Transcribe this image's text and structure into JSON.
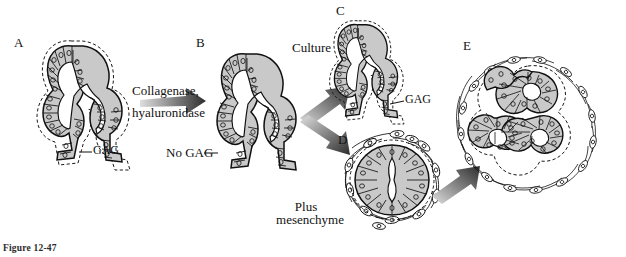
{
  "figure": {
    "caption": "Figure 12-47",
    "background_color": "#ffffff",
    "ink_color": "#111111",
    "cell_fill": "#c9c9c9",
    "mesenchyme_fill": "#ffffff"
  },
  "panels": [
    {
      "id": "A",
      "letter": "A",
      "x": 14,
      "y": 36,
      "description": "epithelial bud with GAG coat"
    },
    {
      "id": "B",
      "letter": "B",
      "x": 196,
      "y": 36,
      "description": "epithelial bud after enzyme, GAG removed"
    },
    {
      "id": "C",
      "letter": "C",
      "x": 336,
      "y": 4,
      "description": "bud in culture, GAG resynthesized"
    },
    {
      "id": "D",
      "letter": "D",
      "x": 338,
      "y": 133,
      "description": "rounded epithelium plus mesenchyme"
    },
    {
      "id": "E",
      "letter": "E",
      "x": 463,
      "y": 39,
      "description": "branched gland with mesenchyme"
    }
  ],
  "labels": {
    "gag_a": "GAG",
    "gag_c": "GAG",
    "no_gag": "No GAG",
    "enzyme_line1": "Collagenase,",
    "enzyme_line2": "hyaluronidase",
    "culture": "Culture",
    "plus_line1": "Plus",
    "plus_line2": "mesenchyme"
  },
  "arrows": [
    {
      "name": "arrow-a-to-b",
      "from": "A",
      "to": "B",
      "direction": "right"
    },
    {
      "name": "arrow-b-to-c",
      "from": "B",
      "to": "C",
      "direction": "up-right"
    },
    {
      "name": "arrow-b-to-d",
      "from": "B",
      "to": "D",
      "direction": "down-right"
    },
    {
      "name": "arrow-d-to-e",
      "from": "D",
      "to": "E",
      "direction": "up-right"
    }
  ]
}
